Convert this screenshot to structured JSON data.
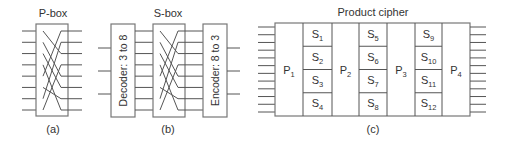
{
  "diagram": {
    "colors": {
      "line": "#555555",
      "box": "#777777",
      "text": "#333333",
      "background": "#ffffff"
    },
    "pbox": {
      "title": "P-box",
      "caption": "(a)",
      "inputs": 8,
      "permutation": [
        2,
        4,
        5,
        7,
        0,
        6,
        1,
        3
      ]
    },
    "sbox": {
      "title": "S-box",
      "caption": "(b)",
      "decoder_label": "Decoder: 3 to 8",
      "encoder_label": "Encoder: 8 to 3",
      "inputs": 3,
      "outputs": 3,
      "permutation": [
        2,
        4,
        5,
        7,
        0,
        6,
        1,
        3
      ]
    },
    "product": {
      "title": "Product cipher",
      "caption": "(c)",
      "inputs": 12,
      "outputs": 12,
      "p_labels": [
        {
          "base": "P",
          "sub": "1"
        },
        {
          "base": "P",
          "sub": "2"
        },
        {
          "base": "P",
          "sub": "3"
        },
        {
          "base": "P",
          "sub": "4"
        }
      ],
      "s_columns": [
        [
          {
            "base": "S",
            "sub": "1"
          },
          {
            "base": "S",
            "sub": "2"
          },
          {
            "base": "S",
            "sub": "3"
          },
          {
            "base": "S",
            "sub": "4"
          }
        ],
        [
          {
            "base": "S",
            "sub": "5"
          },
          {
            "base": "S",
            "sub": "6"
          },
          {
            "base": "S",
            "sub": "7"
          },
          {
            "base": "S",
            "sub": "8"
          }
        ],
        [
          {
            "base": "S",
            "sub": "9"
          },
          {
            "base": "S",
            "sub": "10"
          },
          {
            "base": "S",
            "sub": "11"
          },
          {
            "base": "S",
            "sub": "12"
          }
        ]
      ]
    }
  }
}
